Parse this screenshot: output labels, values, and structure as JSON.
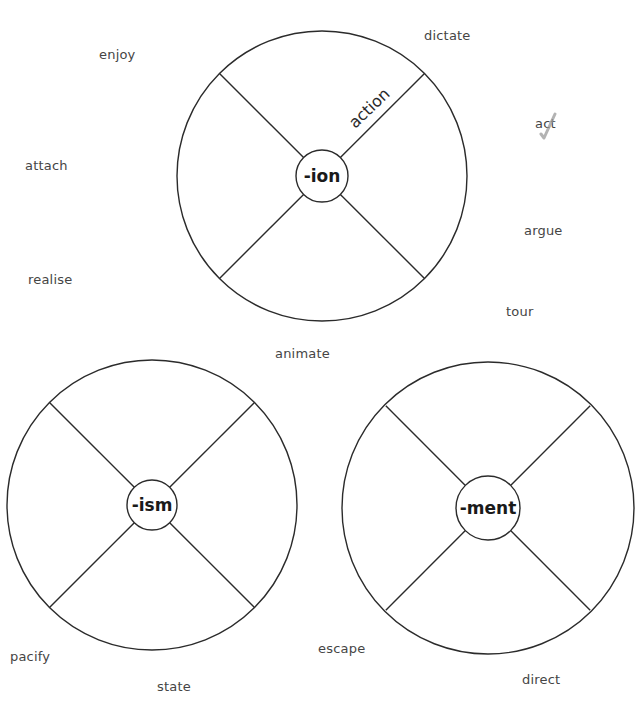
{
  "diagram": {
    "type": "suffix word wheels",
    "colors": {
      "line": "#2b2b2b",
      "word_text": "#454545",
      "suffix_text": "#1a1a1a",
      "check_mark": "#9a9a9a"
    },
    "wheels": [
      {
        "id": "ion",
        "suffix": "-ion",
        "center": [
          322,
          176
        ],
        "outer_radius": 145,
        "inner_radius": 26,
        "segments": [
          {
            "position": "top-right",
            "label": "action"
          },
          {
            "position": "top-left",
            "label": ""
          },
          {
            "position": "bottom-left",
            "label": ""
          },
          {
            "position": "bottom-right",
            "label": ""
          }
        ]
      },
      {
        "id": "ism",
        "suffix": "-ism",
        "center": [
          152,
          505
        ],
        "outer_radius": 145,
        "inner_radius": 25,
        "segments": [
          {
            "position": "top-right",
            "label": ""
          },
          {
            "position": "top-left",
            "label": ""
          },
          {
            "position": "bottom-left",
            "label": ""
          },
          {
            "position": "bottom-right",
            "label": ""
          }
        ]
      },
      {
        "id": "ment",
        "suffix": "-ment",
        "center": [
          488,
          508
        ],
        "outer_radius": 146,
        "inner_radius": 32,
        "segments": [
          {
            "position": "top-right",
            "label": ""
          },
          {
            "position": "top-left",
            "label": ""
          },
          {
            "position": "bottom-left",
            "label": ""
          },
          {
            "position": "bottom-right",
            "label": ""
          }
        ]
      }
    ],
    "words": [
      {
        "text": "enjoy",
        "x": 99,
        "y": 47
      },
      {
        "text": "dictate",
        "x": 424,
        "y": 28
      },
      {
        "text": "act",
        "x": 535,
        "y": 116,
        "checked": true
      },
      {
        "text": "attach",
        "x": 25,
        "y": 158
      },
      {
        "text": "argue",
        "x": 524,
        "y": 223
      },
      {
        "text": "realise",
        "x": 28,
        "y": 272
      },
      {
        "text": "tour",
        "x": 506,
        "y": 304
      },
      {
        "text": "animate",
        "x": 275,
        "y": 346
      },
      {
        "text": "pacify",
        "x": 10,
        "y": 649
      },
      {
        "text": "escape",
        "x": 318,
        "y": 641
      },
      {
        "text": "state",
        "x": 157,
        "y": 679
      },
      {
        "text": "direct",
        "x": 522,
        "y": 672
      }
    ]
  }
}
